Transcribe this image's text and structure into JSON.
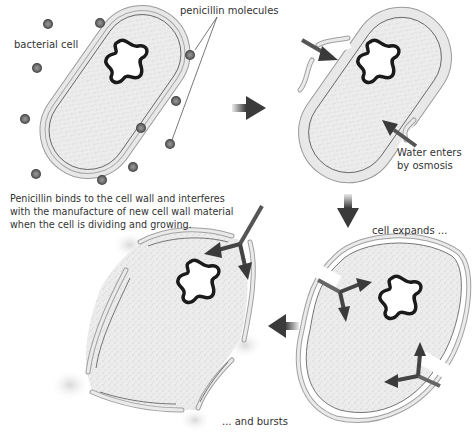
{
  "diagram": {
    "labels": {
      "bacterial_cell": "bacterial cell",
      "penicillin_molecules": "penicillin molecules",
      "water_enters_line1": "Water enters",
      "water_enters_line2": "by osmosis",
      "cell_expands": "cell expands ...",
      "and_bursts": "... and bursts"
    },
    "caption": {
      "line1": "Penicillin binds to the cell wall and interferes",
      "line2": "with the manufacture of new cell wall material",
      "line3": "when the cell is dividing and growing."
    },
    "stages": [
      {
        "name": "intact bacterial cell surrounded by penicillin molecules"
      },
      {
        "name": "water enters by osmosis through damaged wall"
      },
      {
        "name": "cell expands"
      },
      {
        "name": "cell bursts"
      }
    ],
    "colors": {
      "cytoplasm": "#ececec",
      "wall": "#e4e4e4",
      "wall_outline": "#8a8a8a",
      "dna": "#1a1a1a",
      "molecule": "#666666",
      "arrow": "#3a3a3a"
    }
  }
}
